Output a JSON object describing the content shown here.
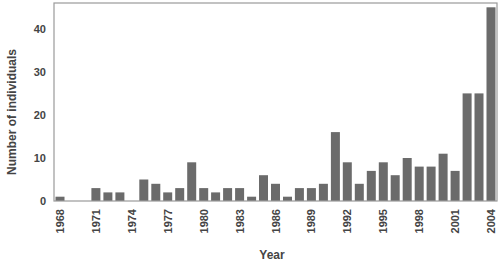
{
  "chart_data": {
    "type": "bar",
    "title": "",
    "xlabel": "Year",
    "ylabel": "Number of individuals",
    "ylim": [
      0,
      46
    ],
    "yticks": [
      0,
      10,
      20,
      30,
      40
    ],
    "xtick_labels": [
      "1968",
      "1971",
      "1974",
      "1977",
      "1980",
      "1983",
      "1986",
      "1989",
      "1992",
      "1995",
      "1998",
      "2001",
      "2004"
    ],
    "grid": false,
    "legend": null,
    "bar_color": "#6b6b6b",
    "categories": [
      "1968",
      "1969",
      "1970",
      "1971",
      "1972",
      "1973",
      "1974",
      "1975",
      "1976",
      "1977",
      "1978",
      "1979",
      "1980",
      "1981",
      "1982",
      "1983",
      "1984",
      "1985",
      "1986",
      "1987",
      "1988",
      "1989",
      "1990",
      "1991",
      "1992",
      "1993",
      "1994",
      "1995",
      "1996",
      "1997",
      "1998",
      "1999",
      "2000",
      "2001",
      "2002",
      "2003",
      "2004"
    ],
    "values": [
      1,
      0,
      0,
      3,
      2,
      2,
      0,
      5,
      4,
      2,
      3,
      9,
      3,
      2,
      3,
      3,
      1,
      6,
      4,
      1,
      3,
      3,
      4,
      16,
      9,
      4,
      7,
      9,
      6,
      10,
      8,
      8,
      11,
      7,
      25,
      25,
      45
    ]
  },
  "layout": {
    "plot_left": 54,
    "plot_right": 497,
    "plot_top": 3,
    "plot_bottom": 201,
    "bar_width": 9
  }
}
